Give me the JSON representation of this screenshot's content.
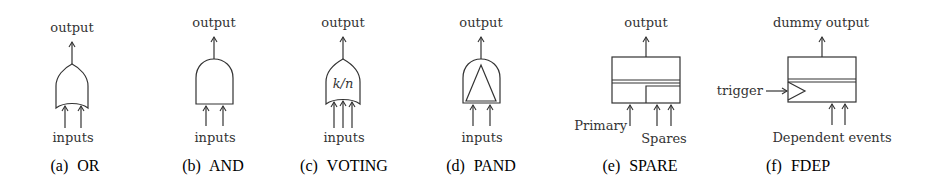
{
  "figure": {
    "panels": [
      {
        "id": "a",
        "caption_letter": "(a)",
        "caption_name": "OR",
        "output_label": "output",
        "inputs_label": "inputs",
        "gate_symbol": "or-gate",
        "input_count": 2
      },
      {
        "id": "b",
        "caption_letter": "(b)",
        "caption_name": "AND",
        "output_label": "output",
        "inputs_label": "inputs",
        "gate_symbol": "and-gate",
        "input_count": 2
      },
      {
        "id": "c",
        "caption_letter": "(c)",
        "caption_name": "VOTING",
        "output_label": "output",
        "inputs_label": "inputs",
        "gate_symbol": "voting-gate",
        "gate_text": "k/n",
        "input_count": 3
      },
      {
        "id": "d",
        "caption_letter": "(d)",
        "caption_name": "PAND",
        "output_label": "output",
        "inputs_label": "inputs",
        "gate_symbol": "pand-gate",
        "input_count": 2
      },
      {
        "id": "e",
        "caption_letter": "(e)",
        "caption_name": "SPARE",
        "output_label": "output",
        "primary_label": "Primary",
        "spares_label": "Spares",
        "gate_symbol": "spare-gate",
        "input_count": 3
      },
      {
        "id": "f",
        "caption_letter": "(f)",
        "caption_name": "FDEP",
        "output_label": "dummy output",
        "trigger_label": "trigger",
        "dependent_label": "Dependent events",
        "gate_symbol": "fdep-gate",
        "input_count": 2
      }
    ]
  },
  "colors": {
    "stroke": "#333333",
    "text": "#333333",
    "background": "#ffffff"
  }
}
